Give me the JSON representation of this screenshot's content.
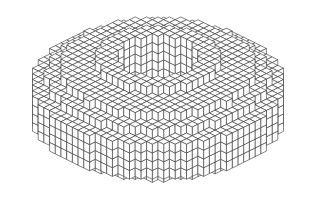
{
  "image": {
    "subject": "voxel-torus",
    "width": 310,
    "height": 214,
    "background": "#ffffff",
    "line_color": "#333333",
    "face_color": "#ffffff"
  },
  "voxel": {
    "outer_radius": 15,
    "inner_radius": 5.2,
    "height": 7,
    "cube": 9.2,
    "center_x": 158,
    "center_y": 62,
    "y_scale": 0.38
  }
}
